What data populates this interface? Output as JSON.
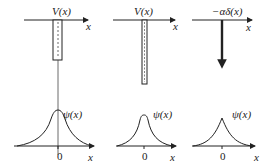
{
  "panels": [
    {
      "potential_label": "V(x)",
      "axis_label": "x",
      "description": "finite square well",
      "wavefunction_label": "ψ(x)",
      "origin_label": "0",
      "wf_axis_label": "x"
    },
    {
      "potential_label": "V(x)",
      "axis_label": "x",
      "description": "narrow deep well",
      "wavefunction_label": "ψ(x)",
      "origin_label": "0",
      "wf_axis_label": "x"
    },
    {
      "potential_label": "−αδ(x)",
      "axis_label": "x",
      "description": "delta-function well",
      "wavefunction_label": "ψ(x)",
      "origin_label": "0",
      "wf_axis_label": "x"
    }
  ],
  "colors": {
    "ink": "#222222",
    "well_fill": "#ffffff"
  }
}
